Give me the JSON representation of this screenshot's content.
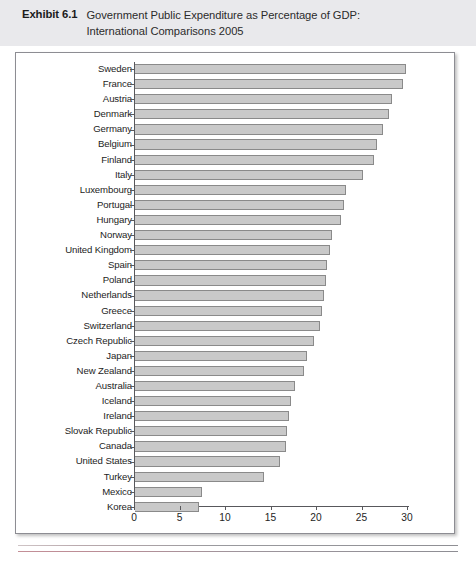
{
  "header": {
    "exhibit_label": "Exhibit 6.1",
    "title_line1": "Government Public Expenditure as Percentage of GDP:",
    "title_line2": "International Comparisons 2005"
  },
  "chart_data": {
    "type": "bar",
    "orientation": "horizontal",
    "title": "Government Public Expenditure as Percentage of GDP: International Comparisons 2005",
    "xlabel": "",
    "ylabel": "",
    "xlim": [
      0,
      30
    ],
    "xticks": [
      "0",
      "5",
      "10",
      "15",
      "20",
      "25",
      "30"
    ],
    "grid": false,
    "legend": "none",
    "bar_color": "#c9c9c9",
    "bar_border_color": "#8a8a8a",
    "categories": [
      "Sweden",
      "France",
      "Austria",
      "Denmark",
      "Germany",
      "Belgium",
      "Finland",
      "Italy",
      "Luxembourg",
      "Portugal",
      "Hungary",
      "Norway",
      "United Kingdom",
      "Spain",
      "Poland",
      "Netherlands",
      "Greece",
      "Switzerland",
      "Czech Republic",
      "Japan",
      "New Zealand",
      "Australia",
      "Iceland",
      "Ireland",
      "Slovak Republic",
      "Canada",
      "United States",
      "Turkey",
      "Mexico",
      "Korea"
    ],
    "values": [
      29.8,
      29.4,
      28.2,
      27.9,
      27.2,
      26.6,
      26.3,
      25.0,
      23.2,
      23.0,
      22.6,
      21.6,
      21.4,
      21.1,
      21.0,
      20.8,
      20.5,
      20.3,
      19.7,
      18.9,
      18.6,
      17.6,
      17.1,
      16.9,
      16.7,
      16.6,
      15.9,
      14.2,
      7.4,
      7.0
    ]
  }
}
